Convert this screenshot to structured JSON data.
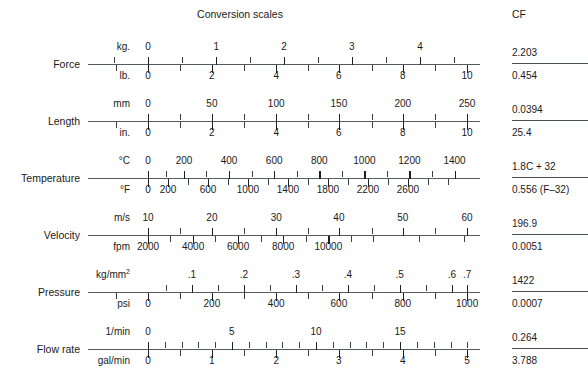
{
  "header": {
    "title": "Conversion scales",
    "cf_header": "CF"
  },
  "colors": {
    "ink": "#1a1a1a",
    "axis": "#555c5f",
    "tick": "#3a3f42",
    "background": "#ffffff"
  },
  "chart_data": {
    "type": "table",
    "title": "Conversion scales",
    "columns": [
      "Quantity",
      "Top unit",
      "Top tick labels",
      "Bottom unit",
      "Bottom tick labels",
      "CF numerator",
      "CF denominator"
    ],
    "rows": [
      {
        "quantity": "Force",
        "top_unit": "kg.",
        "top_labels": [
          "0",
          "1",
          "2",
          "3",
          "4"
        ],
        "top_values": [
          0,
          1,
          2,
          3,
          4
        ],
        "bottom_unit": "lb.",
        "bottom_labels": [
          "0",
          "2",
          "4",
          "6",
          "8",
          "10"
        ],
        "bottom_values": [
          0,
          2,
          4,
          6,
          8,
          10
        ],
        "cf_numerator": "2.203",
        "cf_denominator": "0.454"
      },
      {
        "quantity": "Length",
        "top_unit": "mm",
        "top_labels": [
          "0",
          "50",
          "100",
          "150",
          "200",
          "250"
        ],
        "top_values": [
          0,
          50,
          100,
          150,
          200,
          250
        ],
        "bottom_unit": "in.",
        "bottom_labels": [
          "0",
          "2",
          "4",
          "6",
          "8",
          "10"
        ],
        "bottom_values": [
          0,
          2,
          4,
          6,
          8,
          10
        ],
        "cf_numerator": "0.0394",
        "cf_denominator": "25.4"
      },
      {
        "quantity": "Temperature",
        "top_unit": "°C",
        "top_labels": [
          "0",
          "200",
          "400",
          "600",
          "800",
          "1000",
          "1200",
          "1400"
        ],
        "top_values": [
          0,
          200,
          400,
          600,
          800,
          1000,
          1200,
          1400
        ],
        "bottom_unit": "°F",
        "bottom_labels": [
          "0",
          "200",
          "600",
          "1000",
          "1400",
          "1800",
          "2200",
          "2600"
        ],
        "bottom_values": [
          0,
          200,
          600,
          1000,
          1400,
          1800,
          2200,
          2600
        ],
        "cf_numerator": "1.8C + 32",
        "cf_denominator": "0.556 (F–32)"
      },
      {
        "quantity": "Velocity",
        "top_unit": "m/s",
        "top_labels": [
          "10",
          "20",
          "30",
          "40",
          "50",
          "60"
        ],
        "top_values": [
          10,
          20,
          30,
          40,
          50,
          60
        ],
        "bottom_unit": "fpm",
        "bottom_labels": [
          "2000",
          "4000",
          "6000",
          "8000",
          "10000"
        ],
        "bottom_values": [
          2000,
          4000,
          6000,
          8000,
          10000
        ],
        "cf_numerator": "196.9",
        "cf_denominator": "0.0051"
      },
      {
        "quantity": "Pressure",
        "top_unit": "kg/mm2",
        "top_unit_base": "kg/mm",
        "top_unit_sup": "2",
        "top_labels": [
          ".1",
          ".2",
          ".3",
          ".4",
          ".5",
          ".6",
          ".7"
        ],
        "top_values": [
          0.1,
          0.2,
          0.3,
          0.4,
          0.5,
          0.6,
          0.7
        ],
        "bottom_unit": "psi",
        "bottom_labels": [
          "0",
          "200",
          "400",
          "600",
          "800",
          "1000"
        ],
        "bottom_values": [
          0,
          200,
          400,
          600,
          800,
          1000
        ],
        "cf_numerator": "1422",
        "cf_denominator": "0.0007"
      },
      {
        "quantity": "Flow rate",
        "top_unit": "1/min",
        "top_labels": [
          "0",
          "5",
          "10",
          "15"
        ],
        "top_values": [
          0,
          5,
          10,
          15
        ],
        "bottom_unit": "gal/min",
        "bottom_labels": [
          "0",
          "1",
          "2",
          "3",
          "4",
          "5"
        ],
        "bottom_values": [
          0,
          1,
          2,
          3,
          4,
          5
        ],
        "cf_numerator": "0.264",
        "cf_denominator": "3.788"
      }
    ]
  },
  "scales": [
    {
      "name": "force",
      "label": "Force",
      "top": {
        "unit": "kg.",
        "major_positions": [
          0.153,
          0.327,
          0.5,
          0.673,
          0.847
        ],
        "major_labels": [
          "0",
          "1",
          "2",
          "3",
          "4"
        ],
        "minor_positions": [
          0.066,
          0.24,
          0.413,
          0.587,
          0.76,
          0.934
        ]
      },
      "bottom": {
        "unit": "lb.",
        "major_positions": [
          0.153,
          0.316,
          0.48,
          0.64,
          0.803,
          0.967
        ],
        "major_labels": [
          "0",
          "2",
          "4",
          "6",
          "8",
          "10"
        ],
        "minor_positions": [
          0.072,
          0.235,
          0.398,
          0.561,
          0.724,
          0.885
        ]
      },
      "cf_num": "2.203",
      "cf_den": "0.454"
    },
    {
      "name": "length",
      "label": "Length",
      "top": {
        "unit": "mm",
        "major_positions": [
          0.153,
          0.316,
          0.48,
          0.64,
          0.803,
          0.967
        ],
        "major_labels": [
          "0",
          "50",
          "100",
          "150",
          "200",
          "250"
        ],
        "minor_positions": [
          0.235,
          0.398,
          0.561,
          0.724,
          0.885
        ]
      },
      "bottom": {
        "unit": "in.",
        "major_positions": [
          0.153,
          0.316,
          0.48,
          0.64,
          0.803,
          0.967
        ],
        "major_labels": [
          "0",
          "2",
          "4",
          "6",
          "8",
          "10"
        ],
        "minor_positions": [
          0.072,
          0.235,
          0.398,
          0.561,
          0.724,
          0.885
        ]
      },
      "cf_num": "0.0394",
      "cf_den": "25.4"
    },
    {
      "name": "temperature",
      "label": "Temperature",
      "top": {
        "unit": "°C",
        "major_positions": [
          0.153,
          0.245,
          0.36,
          0.475,
          0.59,
          0.705,
          0.82,
          0.935
        ],
        "major_labels": [
          "0",
          "200",
          "400",
          "600",
          "800",
          "1000",
          "1200",
          "1400"
        ],
        "minor_positions": [
          0.198,
          0.302,
          0.417,
          0.532,
          0.647,
          0.762,
          0.877
        ]
      },
      "bottom": {
        "unit": "°F",
        "major_positions": [
          0.153,
          0.204,
          0.306,
          0.408,
          0.51,
          0.612,
          0.714,
          0.816
        ],
        "major_labels": [
          "0",
          "200",
          "600",
          "1000",
          "1400",
          "1800",
          "2200",
          "2600"
        ],
        "minor_positions": [
          0.255,
          0.357,
          0.459,
          0.561,
          0.663,
          0.765,
          0.867,
          0.918
        ]
      },
      "cf_num": "1.8C + 32",
      "cf_den": "0.556 (F–32)"
    },
    {
      "name": "velocity",
      "label": "Velocity",
      "top": {
        "unit": "m/s",
        "major_positions": [
          0.153,
          0.316,
          0.48,
          0.64,
          0.803,
          0.967
        ],
        "major_labels": [
          "10",
          "20",
          "30",
          "40",
          "50",
          "60"
        ],
        "minor_positions": [
          0.235,
          0.398,
          0.561,
          0.724,
          0.885
        ]
      },
      "bottom": {
        "unit": "fpm",
        "major_positions": [
          0.153,
          0.268,
          0.383,
          0.498,
          0.613
        ],
        "major_labels": [
          "2000",
          "4000",
          "6000",
          "8000",
          "10000"
        ],
        "minor_positions": [
          0.21,
          0.325,
          0.44,
          0.555,
          0.67,
          0.728,
          0.843,
          0.958
        ]
      },
      "cf_num": "196.9",
      "cf_den": "0.0051"
    },
    {
      "name": "pressure",
      "label": "Pressure",
      "top": {
        "unit_base": "kg/mm",
        "unit_sup": "2",
        "major_positions": [
          0.265,
          0.398,
          0.53,
          0.663,
          0.795,
          0.928,
          0.967
        ],
        "major_labels": [
          ".1",
          ".2",
          ".3",
          ".4",
          ".5",
          ".6",
          ".7"
        ],
        "minor_positions": [
          0.199,
          0.332,
          0.464,
          0.597,
          0.729,
          0.862
        ]
      },
      "bottom": {
        "unit": "psi",
        "major_positions": [
          0.153,
          0.316,
          0.48,
          0.64,
          0.803,
          0.967
        ],
        "major_labels": [
          "0",
          "200",
          "400",
          "600",
          "800",
          "1000"
        ],
        "minor_positions": [
          0.072,
          0.235,
          0.398,
          0.561,
          0.724,
          0.885
        ]
      },
      "cf_num": "1422",
      "cf_den": "0.0007"
    },
    {
      "name": "flow-rate",
      "label": "Flow rate",
      "top": {
        "unit": "1/min",
        "major_positions": [
          0.153,
          0.367,
          0.582,
          0.796
        ],
        "major_labels": [
          "0",
          "5",
          "10",
          "15"
        ],
        "minor_positions": [
          0.196,
          0.239,
          0.281,
          0.324,
          0.41,
          0.453,
          0.496,
          0.539,
          0.625,
          0.667,
          0.71,
          0.753,
          0.839,
          0.882,
          0.925,
          0.967
        ]
      },
      "bottom": {
        "unit": "gal/min",
        "major_positions": [
          0.153,
          0.316,
          0.48,
          0.64,
          0.803,
          0.967
        ],
        "major_labels": [
          "0",
          "1",
          "2",
          "3",
          "4",
          "5"
        ],
        "minor_positions": [
          0.235,
          0.398,
          0.561,
          0.724,
          0.885
        ]
      },
      "cf_num": "0.264",
      "cf_den": "3.788"
    }
  ],
  "layout": {
    "row_tops": [
      38,
      95,
      152,
      209,
      266,
      323
    ],
    "axis_left": 88,
    "axis_width": 392,
    "cf_left": 512,
    "cf_width": 76
  }
}
